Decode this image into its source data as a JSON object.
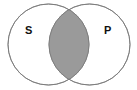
{
  "diagram": {
    "type": "venn",
    "sets": [
      {
        "label": "S"
      },
      {
        "label": "P"
      }
    ],
    "shaded_region": "intersection",
    "colors": {
      "stroke": "#8a8a8a",
      "fill_shaded": "#9a9a9a",
      "background": "#ffffff"
    }
  }
}
